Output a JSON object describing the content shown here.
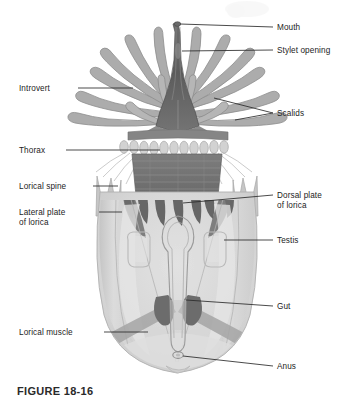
{
  "figure": {
    "caption": "FIGURE 18-16",
    "organism": "loriciferan",
    "view": "whole animal, ventral/dorsal aspect",
    "palette": {
      "background": "#ffffff",
      "leader_line": "#2b2b2b",
      "label_text": "#1c1c1c",
      "mouth_cone_dark": "#5e5e5e",
      "mouth_cone_mid": "#7a7a7a",
      "introvert_scalid": "#a8a8a8",
      "scalid_outline": "#8d8d8d",
      "thorax_dark": "#6f6f6f",
      "thorax_band": "#838383",
      "lorica_plate_light": "#cfcfcf",
      "lorica_body_fill": "#d9d9d9",
      "dorsal_plate_dark": "#6b6b6b",
      "testis_outline": "#b4b4b4",
      "gut_outline": "#9a9a9a",
      "gut_dark": "#6e6e6e",
      "lorical_muscle": "#9d9d9d",
      "spine_fill": "#c6c6c6"
    }
  },
  "labels": {
    "right": [
      {
        "id": "mouth",
        "text": "Mouth",
        "x": 277,
        "y": 30,
        "lines": 1
      },
      {
        "id": "stylet",
        "text": "Stylet opening",
        "x": 277,
        "y": 53,
        "lines": 1
      },
      {
        "id": "scalids",
        "text": "Scalids",
        "x": 277,
        "y": 116,
        "lines": 1
      },
      {
        "id": "dorsal-plate",
        "text": "Dorsal plate",
        "x": 277,
        "y": 198,
        "lines": 2,
        "text2": "of lorica"
      },
      {
        "id": "testis",
        "text": "Testis",
        "x": 277,
        "y": 243,
        "lines": 1
      },
      {
        "id": "gut",
        "text": "Gut",
        "x": 277,
        "y": 309,
        "lines": 1
      },
      {
        "id": "anus",
        "text": "Anus",
        "x": 277,
        "y": 369,
        "lines": 1
      }
    ],
    "left": [
      {
        "id": "introvert",
        "text": "Introvert",
        "x": 19,
        "y": 91,
        "lines": 1
      },
      {
        "id": "thorax",
        "text": "Thorax",
        "x": 19,
        "y": 153,
        "lines": 1
      },
      {
        "id": "lorical-spine",
        "text": "Lorical spine",
        "x": 19,
        "y": 189,
        "lines": 1
      },
      {
        "id": "lateral-plate",
        "text": "Lateral plate",
        "x": 19,
        "y": 215,
        "lines": 2,
        "text2": "of lorica"
      },
      {
        "id": "lorical-muscle",
        "text": "Lorical muscle",
        "x": 19,
        "y": 335,
        "lines": 1
      }
    ]
  },
  "anatomy_parts": [
    "Mouth",
    "Stylet opening",
    "Scalids",
    "Introvert",
    "Thorax",
    "Lorical spine",
    "Lateral plate of lorica",
    "Dorsal plate of lorica",
    "Testis",
    "Gut",
    "Lorical muscle",
    "Anus"
  ]
}
